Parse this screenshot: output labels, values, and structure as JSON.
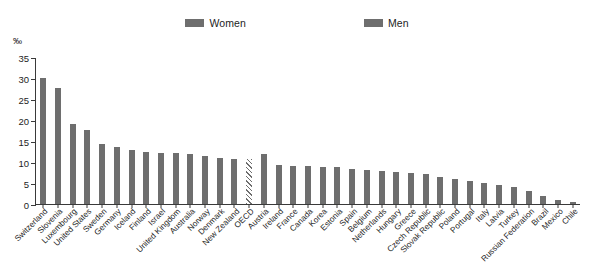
{
  "legend": {
    "entries": [
      {
        "label": "Women",
        "color": "#6e6e6e",
        "icon": "legend-swatch-icon"
      },
      {
        "label": "Men",
        "color": "#6e6e6e",
        "icon": "legend-swatch-icon"
      }
    ]
  },
  "axis": {
    "unit": "‰",
    "ticks": [
      "0",
      "5",
      "10",
      "15",
      "20",
      "25",
      "30",
      "35"
    ]
  },
  "chart_data": {
    "type": "bar",
    "title": "",
    "subtitle": "",
    "xlabel": "",
    "ylabel": "‰",
    "ylim": [
      0,
      35
    ],
    "ytick_values": [
      0,
      5,
      10,
      15,
      20,
      25,
      30,
      35
    ],
    "grid": false,
    "legend_position": "top-center",
    "legend_entries": [
      "Women",
      "Men"
    ],
    "highlight_category": "OECD",
    "highlight_style": "hatched",
    "categories": [
      "Switzerland",
      "Slovenia",
      "Luxembourg",
      "United States",
      "Sweden",
      "Germany",
      "Iceland",
      "Finland",
      "Israel",
      "United Kingdom",
      "Australia",
      "Norway",
      "Denmark",
      "New Zealand",
      "OECD",
      "Austria",
      "Ireland",
      "France",
      "Canada",
      "Korea",
      "Estonia",
      "Spain",
      "Belgium",
      "Netherlands",
      "Hungary",
      "Greece",
      "Czech Republic",
      "Slovak Republic",
      "Poland",
      "Portugal",
      "Italy",
      "Latvia",
      "Turkey",
      "Russian Federation",
      "Brazil",
      "Mexico",
      "Chile"
    ],
    "series": [
      {
        "name": "Women",
        "color": "#6e6e6e",
        "values": [
          30.0,
          27.6,
          19.1,
          17.7,
          14.2,
          13.6,
          12.9,
          12.3,
          12.2,
          12.1,
          11.9,
          11.4,
          10.9,
          10.8,
          10.6,
          12.0,
          9.3,
          9.1,
          9.0,
          8.9,
          8.7,
          8.3,
          8.1,
          7.9,
          7.6,
          7.3,
          7.1,
          6.5,
          6.0,
          5.5,
          5.1,
          4.6,
          4.0,
          3.1,
          1.9,
          0.9,
          0.4
        ]
      }
    ]
  }
}
